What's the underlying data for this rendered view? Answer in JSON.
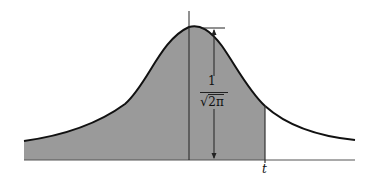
{
  "figure": {
    "labels": {
      "peak_height_numerator": "1",
      "peak_height_sqrt": "√",
      "peak_height_radicand": "2π",
      "t_label": "t"
    },
    "colors": {
      "fill": "#9a9a9a",
      "curve": "#111111",
      "axis": "#555555",
      "background": "#ffffff"
    },
    "geometry": {
      "axis_y": 160,
      "axis_x_start": 24,
      "axis_x_end": 355,
      "mean_x": 189,
      "peak_y": 27,
      "t_x": 265,
      "dimension_arrow_x": 214,
      "peak_tick_y": 28
    }
  }
}
